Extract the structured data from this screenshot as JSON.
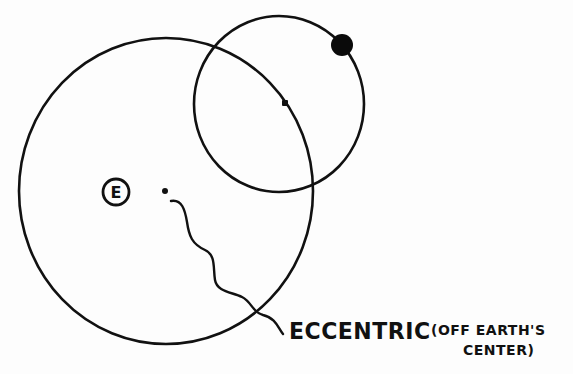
{
  "diagram": {
    "type": "ptolemaic epicycle model",
    "earth_label": "E",
    "caption": {
      "main": "ECCENTRIC",
      "note_line1": "(OFF EARTH'S",
      "note_line2": "CENTER)"
    },
    "elements": {
      "deferent": {
        "cx": 166,
        "cy": 191,
        "rx": 147,
        "ry": 153
      },
      "epicycle": {
        "cx": 279,
        "cy": 104,
        "rx": 85,
        "ry": 88
      },
      "epicycle_center": {
        "x": 285,
        "y": 103
      },
      "planet": {
        "x": 342,
        "y": 45,
        "r": 11
      },
      "earth": {
        "x": 116,
        "y": 192,
        "r": 14
      },
      "eccentric_point": {
        "x": 165,
        "y": 191
      }
    },
    "colors": {
      "ink": "#111111",
      "paper": "#fdfdfd"
    }
  }
}
